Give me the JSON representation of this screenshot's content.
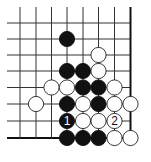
{
  "diagram": {
    "type": "go-problem",
    "grid": {
      "columns": 8,
      "rows": 8,
      "x_positions": [
        20,
        36,
        51.5,
        67,
        83,
        98.5,
        114.5,
        130.5
      ],
      "y_positions": [
        23,
        39,
        55,
        71,
        87.5,
        104,
        121,
        138
      ],
      "left_extent": 7,
      "top_extent": 7,
      "right_edge": true,
      "bottom_edge": true,
      "line_color": "#333333",
      "edge_color": "#111111"
    },
    "stone_radius": 7.6,
    "colors": {
      "black": "#111111",
      "white": "#ffffff",
      "white_outline": "#222222",
      "label_on_black": "#ffffff",
      "label_on_white": "#111111"
    },
    "stones": [
      {
        "color": "black",
        "col": 3,
        "row": 1,
        "label": ""
      },
      {
        "color": "white",
        "col": 5,
        "row": 2,
        "label": ""
      },
      {
        "color": "black",
        "col": 3,
        "row": 3,
        "label": ""
      },
      {
        "color": "black",
        "col": 4,
        "row": 3,
        "label": ""
      },
      {
        "color": "white",
        "col": 5,
        "row": 3,
        "label": ""
      },
      {
        "color": "white",
        "col": 2,
        "row": 4,
        "label": ""
      },
      {
        "color": "white",
        "col": 3,
        "row": 4,
        "label": ""
      },
      {
        "color": "black",
        "col": 4,
        "row": 4,
        "label": ""
      },
      {
        "color": "black",
        "col": 5,
        "row": 4,
        "label": ""
      },
      {
        "color": "white",
        "col": 6,
        "row": 4,
        "label": ""
      },
      {
        "color": "white",
        "col": 1,
        "row": 5,
        "label": ""
      },
      {
        "color": "black",
        "col": 3,
        "row": 5,
        "label": ""
      },
      {
        "color": "white",
        "col": 4,
        "row": 5,
        "label": ""
      },
      {
        "color": "black",
        "col": 5,
        "row": 5,
        "label": ""
      },
      {
        "color": "white",
        "col": 6,
        "row": 5,
        "label": ""
      },
      {
        "color": "white",
        "col": 7,
        "row": 5,
        "label": ""
      },
      {
        "color": "black",
        "col": 3,
        "row": 6,
        "label": "1"
      },
      {
        "color": "white",
        "col": 4,
        "row": 6,
        "label": ""
      },
      {
        "color": "white",
        "col": 5,
        "row": 6,
        "label": ""
      },
      {
        "color": "white",
        "col": 6,
        "row": 6,
        "label": "2"
      },
      {
        "color": "black",
        "col": 3,
        "row": 7,
        "label": ""
      },
      {
        "color": "black",
        "col": 4,
        "row": 7,
        "label": ""
      },
      {
        "color": "black",
        "col": 5,
        "row": 7,
        "label": ""
      },
      {
        "color": "white",
        "col": 6,
        "row": 7,
        "label": ""
      },
      {
        "color": "white",
        "col": 7,
        "row": 7,
        "label": ""
      }
    ]
  }
}
